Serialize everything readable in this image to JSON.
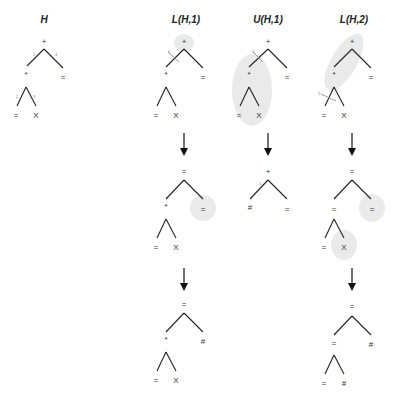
{
  "columns": [
    {
      "title": "H"
    },
    {
      "title": "L(H,1)"
    },
    {
      "title": "U(H,1)"
    },
    {
      "title": "L(H,2)"
    }
  ],
  "trees": {
    "H": {
      "root": "+",
      "left": "*",
      "right": "=",
      "leftLeft": "=",
      "leftRight": "X",
      "edge_labels": [
        "1",
        "4",
        "2",
        "3"
      ]
    },
    "L1_step0": {
      "root": "+",
      "left": "*",
      "right": "=",
      "leftLeft": "=",
      "leftRight": "X",
      "edge_label": "1"
    },
    "U1_step0": {
      "root": "+",
      "left": "*",
      "right": "=",
      "leftLeft": "=",
      "leftRight": "X",
      "edge_label": "1"
    },
    "L2_step0": {
      "root": "+",
      "left": "*",
      "right": "=",
      "leftLeft": "=",
      "leftRight": "X",
      "edge_label": "2"
    },
    "L1_step1": {
      "root": "=",
      "left": "*",
      "right": "=",
      "leftLeft": "=",
      "leftRight": "X"
    },
    "U1_step1": {
      "root": "+",
      "left": "#",
      "right": "=",
      "edge_label": "1"
    },
    "L2_step1": {
      "root": "=",
      "left": "=",
      "right": "=",
      "leftLeft": "=",
      "leftRight": "X"
    },
    "L1_step2": {
      "root": "=",
      "left": "*",
      "right": "#",
      "leftLeft": "=",
      "leftRight": "X"
    },
    "L2_step2": {
      "root": "=",
      "left": "=",
      "right": "#",
      "leftLeft": "=",
      "leftRight": "#"
    }
  },
  "colors": {
    "highlight": "#d9d9d9",
    "line": "#222222"
  }
}
